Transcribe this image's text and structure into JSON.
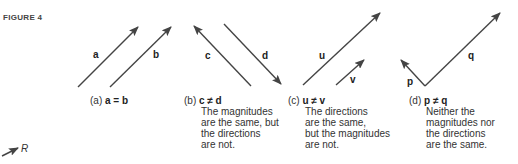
{
  "figure": {
    "label": "FIGURE 4",
    "vectors": [
      {
        "name": "a",
        "x1": 78,
        "y1": 87,
        "x2": 138,
        "y2": 27
      },
      {
        "name": "b",
        "x1": 110,
        "y1": 87,
        "x2": 171,
        "y2": 27
      },
      {
        "name": "c",
        "x1": 251,
        "y1": 86,
        "x2": 194,
        "y2": 26
      },
      {
        "name": "d",
        "x1": 224,
        "y1": 24,
        "x2": 281,
        "y2": 84
      },
      {
        "name": "u",
        "x1": 303,
        "y1": 85,
        "x2": 380,
        "y2": 13
      },
      {
        "name": "v",
        "x1": 336,
        "y1": 85,
        "x2": 364,
        "y2": 60
      },
      {
        "name": "p",
        "x1": 425,
        "y1": 86,
        "x2": 401,
        "y2": 60
      },
      {
        "name": "q",
        "x1": 425,
        "y1": 86,
        "x2": 500,
        "y2": 13
      }
    ],
    "panels": [
      {
        "id": "a",
        "prefix": "(a)",
        "relation": "a = b",
        "description": []
      },
      {
        "id": "b",
        "prefix": "(b)",
        "relation": "c ≠ d",
        "description": [
          "The magnitudes",
          "are the same, but",
          "the directions",
          "are not."
        ]
      },
      {
        "id": "c",
        "prefix": "(c)",
        "relation": "u ≠ v",
        "description": [
          "The directions",
          "are the same,",
          "but the magnitudes",
          "are not."
        ]
      },
      {
        "id": "d",
        "prefix": "(d)",
        "relation": "p ≠ q",
        "description": [
          "Neither the",
          "magnitudes nor",
          "the directions",
          "are the same."
        ]
      }
    ],
    "stray_label": "R",
    "colors": {
      "arrow": "#444444",
      "text": "#333333"
    }
  }
}
